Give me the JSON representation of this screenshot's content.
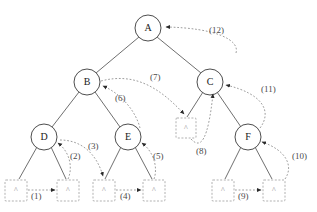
{
  "diagram": {
    "type": "tree-diagram",
    "width": 317,
    "height": 212,
    "colors": {
      "background": "#ffffff",
      "node_stroke": "#3a3a3a",
      "node_fill": "#ffffff",
      "edge": "#4a4a4a",
      "dashed_arrow": "#9a9a9a",
      "nil_box": "#a0a0a0",
      "text": "#1a1a1a",
      "label_text": "#4a4a4a"
    },
    "nodes": [
      {
        "id": "A",
        "label": "A",
        "cx": 148,
        "cy": 28,
        "r": 13
      },
      {
        "id": "B",
        "label": "B",
        "cx": 87,
        "cy": 82,
        "r": 13
      },
      {
        "id": "C",
        "label": "C",
        "cx": 210,
        "cy": 82,
        "r": 13
      },
      {
        "id": "D",
        "label": "D",
        "cx": 44,
        "cy": 137,
        "r": 13
      },
      {
        "id": "E",
        "label": "E",
        "cx": 128,
        "cy": 137,
        "r": 13
      },
      {
        "id": "F",
        "label": "F",
        "cx": 248,
        "cy": 137,
        "r": 13
      }
    ],
    "nil_nodes": [
      {
        "id": "nil1",
        "glyph": "^",
        "x": 5,
        "y": 180,
        "w": 22,
        "h": 21
      },
      {
        "id": "nil2",
        "glyph": "^",
        "x": 57,
        "y": 180,
        "w": 22,
        "h": 21
      },
      {
        "id": "nil3",
        "glyph": "^",
        "x": 93,
        "y": 180,
        "w": 22,
        "h": 21
      },
      {
        "id": "nil4",
        "glyph": "^",
        "x": 143,
        "y": 180,
        "w": 22,
        "h": 21
      },
      {
        "id": "nil5",
        "glyph": "^",
        "x": 176,
        "y": 118,
        "w": 20,
        "h": 20
      },
      {
        "id": "nil6",
        "glyph": "^",
        "x": 212,
        "y": 180,
        "w": 22,
        "h": 21
      },
      {
        "id": "nil7",
        "glyph": "^",
        "x": 263,
        "y": 180,
        "w": 22,
        "h": 21
      }
    ],
    "tree_edges": [
      {
        "from": "A",
        "to": "B"
      },
      {
        "from": "A",
        "to": "C"
      },
      {
        "from": "B",
        "to": "D"
      },
      {
        "from": "B",
        "to": "E"
      },
      {
        "from": "C",
        "to": "nil5"
      },
      {
        "from": "C",
        "to": "F"
      },
      {
        "from": "D",
        "to": "nil1"
      },
      {
        "from": "D",
        "to": "nil2"
      },
      {
        "from": "E",
        "to": "nil3"
      },
      {
        "from": "E",
        "to": "nil4"
      },
      {
        "from": "F",
        "to": "nil6"
      },
      {
        "from": "F",
        "to": "nil7"
      }
    ],
    "steps": [
      {
        "n": 1,
        "label": "(1)",
        "x": 33,
        "y": 196,
        "from": "nil1",
        "to": "nil2"
      },
      {
        "n": 2,
        "label": "(2)",
        "x": 72,
        "y": 156,
        "from": "nil2",
        "to": "D"
      },
      {
        "n": 3,
        "label": "(3)",
        "x": 90,
        "y": 146,
        "from": "D",
        "to": "nil3"
      },
      {
        "n": 4,
        "label": "(4)",
        "x": 122,
        "y": 196,
        "from": "nil3",
        "to": "nil4"
      },
      {
        "n": 5,
        "label": "(5)",
        "x": 155,
        "y": 156,
        "from": "nil4",
        "to": "E"
      },
      {
        "n": 6,
        "label": "(6)",
        "x": 117,
        "y": 98,
        "from": "E",
        "to": "B"
      },
      {
        "n": 7,
        "label": "(7)",
        "x": 152,
        "y": 77,
        "from": "B",
        "to": "nil5"
      },
      {
        "n": 8,
        "label": "(8)",
        "x": 198,
        "y": 151,
        "from": "nil5",
        "to": "C"
      },
      {
        "n": 9,
        "label": "(9)",
        "x": 240,
        "y": 196,
        "from": "nil6",
        "to": "nil7"
      },
      {
        "n": 10,
        "label": "(10)",
        "x": 295,
        "y": 156,
        "from": "nil7",
        "to": "F"
      },
      {
        "n": 11,
        "label": "(11)",
        "x": 264,
        "y": 89,
        "from": "F",
        "to": "C"
      },
      {
        "n": 12,
        "label": "(12)",
        "x": 212,
        "y": 30,
        "from": "C",
        "to": "A"
      }
    ]
  }
}
